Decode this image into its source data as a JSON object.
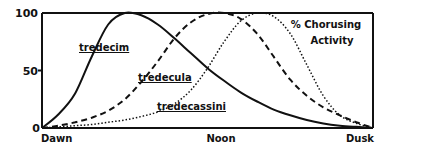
{
  "chart_data": {
    "type": "line",
    "title": "% Chorusing Activity",
    "title_lines": [
      "% Chorusing",
      "Activity"
    ],
    "xlabel": "",
    "ylabel": "",
    "x_tick_labels": [
      "Dawn",
      "Noon",
      "Dusk"
    ],
    "y_tick_labels": [
      "0",
      "50",
      "100"
    ],
    "x_range": [
      0,
      1
    ],
    "ylim": [
      0,
      100
    ],
    "grid": false,
    "legend_position": "inline labels",
    "x": [
      0.0,
      0.05,
      0.1,
      0.15,
      0.2,
      0.25,
      0.3,
      0.35,
      0.4,
      0.45,
      0.5,
      0.55,
      0.6,
      0.65,
      0.7,
      0.75,
      0.8,
      0.85,
      0.9,
      0.95,
      1.0
    ],
    "series": [
      {
        "name": "tredecim",
        "style": "solid",
        "values": [
          0,
          12,
          30,
          62,
          90,
          100,
          98,
          90,
          78,
          65,
          52,
          41,
          31,
          23,
          16,
          11,
          7,
          4,
          2,
          1,
          0
        ]
      },
      {
        "name": "tredecula",
        "style": "dashed",
        "values": [
          0,
          2,
          5,
          9,
          15,
          25,
          40,
          58,
          78,
          92,
          99,
          100,
          95,
          82,
          62,
          42,
          28,
          18,
          11,
          5,
          0
        ]
      },
      {
        "name": "tredecassini",
        "style": "dotted",
        "values": [
          0,
          1,
          2,
          3,
          5,
          7,
          10,
          14,
          21,
          33,
          52,
          75,
          93,
          100,
          97,
          82,
          55,
          28,
          11,
          4,
          0
        ]
      }
    ],
    "series_labels": [
      "tredecim",
      "tredecula",
      "tredecassini"
    ]
  }
}
